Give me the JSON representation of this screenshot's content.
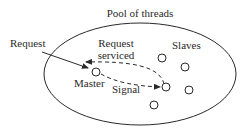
{
  "diagram": {
    "title": "Pool of threads",
    "labels": {
      "request": "Request",
      "request_serviced_line1": "Request",
      "request_serviced_line2": "serviced",
      "slaves": "Slaves",
      "master": "Master",
      "signal": "Signal"
    },
    "nodes": {
      "master": {
        "x": 96,
        "y": 72
      },
      "slaves": [
        {
          "x": 162,
          "y": 58
        },
        {
          "x": 185,
          "y": 67
        },
        {
          "x": 166,
          "y": 87
        },
        {
          "x": 189,
          "y": 90
        },
        {
          "x": 154,
          "y": 105
        }
      ]
    },
    "edges": [
      {
        "from": "external",
        "to": "master",
        "label": "Request",
        "style": "solid"
      },
      {
        "from": "master",
        "to": "slave",
        "label": "Signal",
        "style": "dashed"
      },
      {
        "from": "slave",
        "to": "external",
        "label": "Request serviced",
        "style": "dashed"
      }
    ],
    "colors": {
      "stroke": "#2a2a2a",
      "background": "#ffffff"
    }
  }
}
